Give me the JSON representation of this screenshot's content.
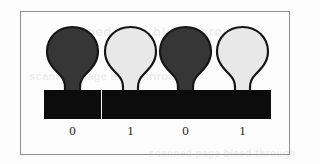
{
  "figure": {
    "kind": "binary-state-lightbulb-diagram",
    "border_color": "#8f8f93",
    "background_color": "#fcfcfc",
    "page_background": "#fdfdfd",
    "ghost_text": {
      "top": "scanned page bleed-through",
      "middle": "scanned page bleed-through",
      "bottom": "scanned page bleed-through"
    },
    "colors": {
      "bulb_on_fill": "#e8e8e8",
      "bulb_off_fill": "#363636",
      "bulb_outline": "#151515",
      "base_fill": "#0c0c0c",
      "label_color": "#1d1d1d"
    },
    "bulbs": [
      {
        "index": 0,
        "state": "off",
        "label": "0",
        "fill": "#363636",
        "x": 22
      },
      {
        "index": 1,
        "state": "on",
        "label": "1",
        "fill": "#e8e8e8",
        "x": 80
      },
      {
        "index": 2,
        "state": "off",
        "label": "0",
        "fill": "#363636",
        "x": 135
      },
      {
        "index": 3,
        "state": "on",
        "label": "1",
        "fill": "#e8e8e8",
        "x": 192
      }
    ],
    "binary_value": "0101"
  }
}
